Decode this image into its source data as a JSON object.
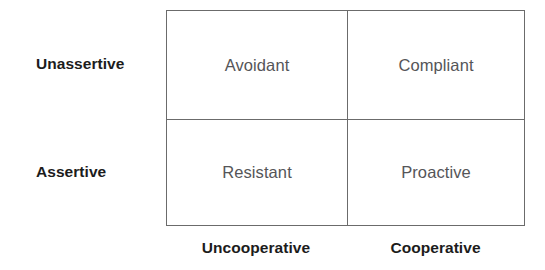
{
  "diagram": {
    "type": "2x2-matrix",
    "row_axis_labels": [
      {
        "label": "Unassertive"
      },
      {
        "label": "Assertive"
      }
    ],
    "column_axis_labels": [
      {
        "label": "Uncooperative"
      },
      {
        "label": "Cooperative"
      }
    ],
    "cells": [
      {
        "label": "Avoidant",
        "row": "Unassertive",
        "column": "Uncooperative"
      },
      {
        "label": "Compliant",
        "row": "Unassertive",
        "column": "Cooperative"
      },
      {
        "label": "Resistant",
        "row": "Assertive",
        "column": "Uncooperative"
      },
      {
        "label": "Proactive",
        "row": "Assertive",
        "column": "Cooperative"
      }
    ],
    "colors": {
      "background": "#ffffff",
      "border": "#6b6b6b",
      "cell_text": "#555558",
      "axis_label_text": "#1c1c1c"
    }
  }
}
